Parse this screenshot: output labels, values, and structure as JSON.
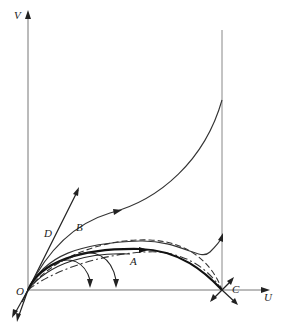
{
  "diagram": {
    "type": "phase-plane",
    "axes": {
      "x_label": "U",
      "y_label": "V"
    },
    "points": {
      "origin": "O",
      "equilibrium_c": "C"
    },
    "trajectories": {
      "a": "A",
      "b": "B",
      "d": "D"
    },
    "colors": {
      "ink": "#222222",
      "axis": "#666666",
      "background": "#ffffff"
    }
  }
}
